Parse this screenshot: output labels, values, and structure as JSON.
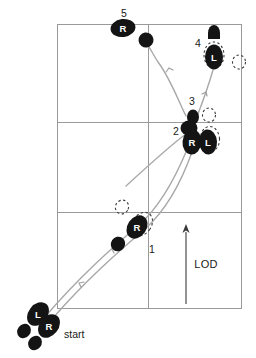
{
  "diagram": {
    "type": "footwork-chart",
    "background_color": "#ffffff",
    "grid": {
      "line_color": "#9a9a9a",
      "left": 57,
      "top": 24,
      "right": 241,
      "bottom": 308,
      "vertical_divider_x": 148,
      "horizontal_divider_y": [
        122,
        212
      ],
      "columns": 2,
      "rows": 3
    },
    "path": {
      "color": "#a8a8a8",
      "style": "double-track-with-direction-arrows",
      "arrow_count": 5
    }
  },
  "footprints": [
    {
      "id": "start-left",
      "label": "L",
      "step_number": null,
      "kind": "solid",
      "foot": "left",
      "cx": 38,
      "cy": 314,
      "rx": 9.5,
      "ry": 13,
      "rotate": 38
    },
    {
      "id": "start-right",
      "label": "R",
      "step_number": null,
      "kind": "solid",
      "foot": "right",
      "cx": 49,
      "cy": 326,
      "rx": 9.5,
      "ry": 13,
      "rotate": 38
    },
    {
      "id": "start-heel-left",
      "label": "",
      "step_number": null,
      "kind": "solid-heel",
      "foot": "left",
      "cx": 24,
      "cy": 331,
      "rx": 6.5,
      "ry": 7,
      "rotate": 38
    },
    {
      "id": "start-heel-right",
      "label": "",
      "step_number": null,
      "kind": "solid-heel",
      "foot": "right",
      "cx": 35,
      "cy": 343,
      "rx": 6.5,
      "ry": 7,
      "rotate": 38
    },
    {
      "id": "step-1-right",
      "label": "R",
      "step_number": "1",
      "kind": "solid",
      "foot": "right",
      "cx": 137,
      "cy": 227,
      "rx": 9.5,
      "ry": 12.5,
      "rotate": 34
    },
    {
      "id": "step-1-ghost",
      "label": "",
      "step_number": null,
      "kind": "dashed",
      "foot": "right",
      "cx": 142,
      "cy": 224,
      "rx": 9.5,
      "ry": 12.5,
      "rotate": 34
    },
    {
      "id": "step-1-heel",
      "label": "",
      "step_number": null,
      "kind": "solid-heel",
      "foot": "right",
      "cx": 118,
      "cy": 244,
      "rx": 7,
      "ry": 7.5,
      "rotate": 34
    },
    {
      "id": "step-1-ghost-heel",
      "label": "",
      "step_number": null,
      "kind": "dashed-heel",
      "foot": "right",
      "cx": 122,
      "cy": 207,
      "rx": 6.5,
      "ry": 7,
      "rotate": 30
    },
    {
      "id": "step-2-right",
      "label": "R",
      "step_number": "2",
      "kind": "solid",
      "foot": "right",
      "cx": 192,
      "cy": 141,
      "rx": 9.5,
      "ry": 12.5,
      "rotate": 5
    },
    {
      "id": "step-2-left",
      "label": "L",
      "step_number": null,
      "kind": "solid",
      "foot": "left",
      "cx": 208,
      "cy": 141,
      "rx": 9,
      "ry": 12.5,
      "rotate": -4
    },
    {
      "id": "step-2-left-ghost",
      "label": "",
      "step_number": null,
      "kind": "dashed",
      "foot": "left",
      "cx": 210,
      "cy": 139,
      "rx": 9.5,
      "ry": 12.5,
      "rotate": -4
    },
    {
      "id": "step-2-heel",
      "label": "",
      "step_number": null,
      "kind": "solid-heel",
      "foot": "right",
      "cx": 189,
      "cy": 127,
      "rx": 7.5,
      "ry": 7,
      "rotate": 0
    },
    {
      "id": "step-3-heel",
      "label": "",
      "step_number": "3",
      "kind": "solid-heel",
      "foot": "left",
      "cx": 193,
      "cy": 117,
      "rx": 6,
      "ry": 7,
      "rotate": 0
    },
    {
      "id": "step-3-ghost",
      "label": "",
      "step_number": null,
      "kind": "dashed-heel",
      "foot": "left",
      "cx": 209,
      "cy": 115,
      "rx": 6.5,
      "ry": 7,
      "rotate": 0
    },
    {
      "id": "step-4-left",
      "label": "L",
      "step_number": "4",
      "kind": "solid",
      "foot": "left",
      "cx": 214,
      "cy": 57,
      "rx": 9,
      "ry": 12.5,
      "rotate": 0
    },
    {
      "id": "step-4-ghost",
      "label": "",
      "step_number": null,
      "kind": "dashed",
      "foot": "left",
      "cx": 214,
      "cy": 55,
      "rx": 10,
      "ry": 13,
      "rotate": 0
    },
    {
      "id": "step-4-heel",
      "label": "",
      "step_number": null,
      "kind": "solid-heel",
      "foot": "left",
      "cx": 214,
      "cy": 32,
      "rx": 6,
      "ry": 7,
      "rotate": 0
    },
    {
      "id": "step-4-ghost-right",
      "label": "",
      "step_number": null,
      "kind": "dashed-heel",
      "foot": "left",
      "cx": 239,
      "cy": 62,
      "rx": 6.5,
      "ry": 7,
      "rotate": 0
    },
    {
      "id": "step-5-right",
      "label": "R",
      "step_number": "5",
      "kind": "solid",
      "foot": "right",
      "cx": 123,
      "cy": 28,
      "rx": 12.5,
      "ry": 9,
      "rotate": -8
    },
    {
      "id": "step-5-heel",
      "label": "",
      "step_number": null,
      "kind": "solid-heel",
      "foot": "right",
      "cx": 146,
      "cy": 40,
      "rx": 7.5,
      "ry": 7,
      "rotate": -8
    }
  ],
  "step_numbers": [
    {
      "id": "num-1",
      "text": "1",
      "x": 152,
      "y": 249
    },
    {
      "id": "num-2",
      "text": "2",
      "x": 176,
      "y": 131
    },
    {
      "id": "num-3",
      "text": "3",
      "x": 192,
      "y": 101
    },
    {
      "id": "num-4",
      "text": "4",
      "x": 198,
      "y": 43
    },
    {
      "id": "num-5",
      "text": "5",
      "x": 124,
      "y": 13
    }
  ],
  "annotations": {
    "start_label": {
      "text": "start",
      "x": 64,
      "y": 334
    },
    "lod": {
      "text": "LOD",
      "text_x": 204,
      "text_y": 264,
      "arrow_x": 186,
      "arrow_top_y": 226,
      "arrow_bottom_y": 304
    }
  },
  "colors": {
    "grid": "#9a9a9a",
    "path": "#a8a8a8",
    "foot_solid": "#141414",
    "foot_dashed": "#3c3c3c",
    "text": "#1a1a1a",
    "foot_label": "#ffffff",
    "background": "#ffffff"
  }
}
